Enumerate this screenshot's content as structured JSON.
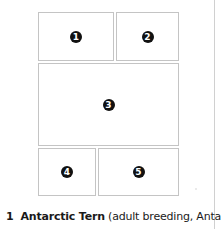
{
  "plate": {
    "panels": [
      {
        "number": "1"
      },
      {
        "number": "2"
      },
      {
        "number": "3"
      },
      {
        "number": "4"
      },
      {
        "number": "5"
      }
    ]
  },
  "caption": {
    "index": "1",
    "species": "Antarctic Tern",
    "detail": "(adult breeding, Antarctic"
  }
}
